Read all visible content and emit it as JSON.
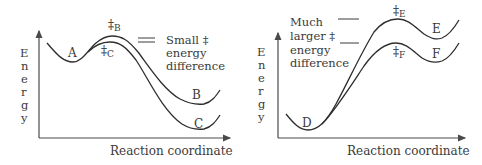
{
  "left_panel": {
    "y_axis_label": [
      "E",
      "n",
      "e",
      "r",
      "g",
      "y"
    ],
    "x_axis_label": "Reaction coordinate",
    "labels": {
      "reactant": "A",
      "ts_b_symbol": "‡",
      "ts_b_sub": "B",
      "ts_c_symbol": "‡",
      "ts_c_sub": "C",
      "product_b": "B",
      "product_c": "C"
    },
    "annotation": [
      "Small ‡",
      "energy",
      "difference"
    ]
  },
  "right_panel": {
    "y_axis_label": [
      "E",
      "n",
      "e",
      "r",
      "g",
      "y"
    ],
    "x_axis_label": "Reaction coordinate",
    "labels": {
      "reactant": "D",
      "ts_e_symbol": "‡",
      "ts_e_sub": "E",
      "ts_f_symbol": "‡",
      "ts_f_sub": "F",
      "product_e": "E",
      "product_f": "F"
    },
    "annotation": [
      "Much",
      "larger ‡",
      "energy",
      "difference"
    ]
  },
  "colors": {
    "line": "#2e2e2e",
    "text": "#3a3a3a",
    "background": "#ffffff"
  }
}
